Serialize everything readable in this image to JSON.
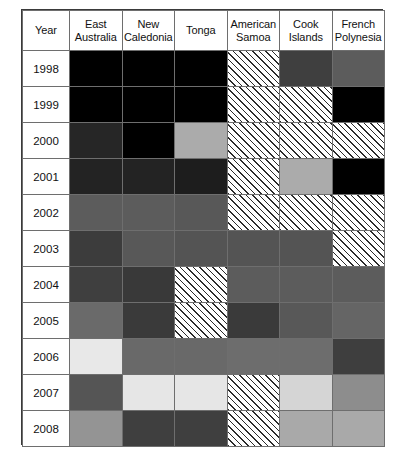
{
  "figure": {
    "type": "matrix-table",
    "row_header_label": "Year"
  },
  "chart_data": {
    "type": "heatmap",
    "title": "",
    "xlabel": "",
    "ylabel": "Year",
    "grid": true,
    "legend_position": "none",
    "row_header": "Year",
    "categories": [
      "East Australia",
      "New Caledonia",
      "Tonga",
      "American Samoa",
      "Cook Islands",
      "French Polynesia"
    ],
    "rows": [
      "1998",
      "1999",
      "2000",
      "2001",
      "2002",
      "2003",
      "2004",
      "2005",
      "2006",
      "2007",
      "2008"
    ],
    "palette": {
      "black": "#000000",
      "very-dark-gray": "#252525",
      "dark-gray": "#3c3c3c",
      "medium-dark-gray": "#4a4a4a",
      "medium-gray": "#5a5a5a",
      "gray": "#6a6a6a",
      "light-medium-gray": "#8d8d8d",
      "light-gray": "#a8a8a8",
      "very-light-gray": "#c9c9c9",
      "near-white": "#e8e8e8",
      "hatched": "diagonal-hatch"
    },
    "cells": [
      {
        "year": "1998",
        "values": [
          {
            "shade": "black",
            "color": "#000000",
            "hatched": false
          },
          {
            "shade": "black",
            "color": "#000000",
            "hatched": false
          },
          {
            "shade": "black",
            "color": "#000000",
            "hatched": false
          },
          {
            "shade": "hatched",
            "color": "#ffffff",
            "hatched": true
          },
          {
            "shade": "dark-gray",
            "color": "#3f3f3f",
            "hatched": false
          },
          {
            "shade": "medium-gray",
            "color": "#5c5c5c",
            "hatched": false
          }
        ]
      },
      {
        "year": "1999",
        "values": [
          {
            "shade": "black",
            "color": "#000000",
            "hatched": false
          },
          {
            "shade": "black",
            "color": "#000000",
            "hatched": false
          },
          {
            "shade": "black",
            "color": "#000000",
            "hatched": false
          },
          {
            "shade": "hatched",
            "color": "#ffffff",
            "hatched": true
          },
          {
            "shade": "hatched",
            "color": "#ffffff",
            "hatched": true
          },
          {
            "shade": "black",
            "color": "#000000",
            "hatched": false
          }
        ]
      },
      {
        "year": "2000",
        "values": [
          {
            "shade": "very-dark-gray",
            "color": "#262626",
            "hatched": false
          },
          {
            "shade": "black",
            "color": "#000000",
            "hatched": false
          },
          {
            "shade": "light-gray",
            "color": "#ababab",
            "hatched": false
          },
          {
            "shade": "hatched",
            "color": "#ffffff",
            "hatched": true
          },
          {
            "shade": "hatched",
            "color": "#ffffff",
            "hatched": true
          },
          {
            "shade": "hatched",
            "color": "#ffffff",
            "hatched": true
          }
        ]
      },
      {
        "year": "2001",
        "values": [
          {
            "shade": "very-dark-gray",
            "color": "#232323",
            "hatched": false
          },
          {
            "shade": "very-dark-gray",
            "color": "#232323",
            "hatched": false
          },
          {
            "shade": "very-dark-gray",
            "color": "#1d1d1d",
            "hatched": false
          },
          {
            "shade": "hatched",
            "color": "#ffffff",
            "hatched": true
          },
          {
            "shade": "light-gray",
            "color": "#ababab",
            "hatched": false
          },
          {
            "shade": "black",
            "color": "#000000",
            "hatched": false
          }
        ]
      },
      {
        "year": "2002",
        "values": [
          {
            "shade": "medium-gray",
            "color": "#5c5c5c",
            "hatched": false
          },
          {
            "shade": "medium-gray",
            "color": "#5c5c5c",
            "hatched": false
          },
          {
            "shade": "medium-gray",
            "color": "#585858",
            "hatched": false
          },
          {
            "shade": "hatched",
            "color": "#ffffff",
            "hatched": true
          },
          {
            "shade": "hatched",
            "color": "#ffffff",
            "hatched": true
          },
          {
            "shade": "hatched",
            "color": "#ffffff",
            "hatched": true
          }
        ]
      },
      {
        "year": "2003",
        "values": [
          {
            "shade": "dark-gray",
            "color": "#3c3c3c",
            "hatched": false
          },
          {
            "shade": "medium-gray",
            "color": "#585858",
            "hatched": false
          },
          {
            "shade": "medium-gray",
            "color": "#545454",
            "hatched": false
          },
          {
            "shade": "medium-gray",
            "color": "#545454",
            "hatched": false
          },
          {
            "shade": "medium-gray",
            "color": "#545454",
            "hatched": false
          },
          {
            "shade": "hatched",
            "color": "#ffffff",
            "hatched": true
          }
        ]
      },
      {
        "year": "2004",
        "values": [
          {
            "shade": "dark-gray",
            "color": "#3f3f3f",
            "hatched": false
          },
          {
            "shade": "dark-gray",
            "color": "#393939",
            "hatched": false
          },
          {
            "shade": "hatched",
            "color": "#ffffff",
            "hatched": true
          },
          {
            "shade": "medium-gray",
            "color": "#5c5c5c",
            "hatched": false
          },
          {
            "shade": "medium-gray",
            "color": "#5c5c5c",
            "hatched": false
          },
          {
            "shade": "medium-gray",
            "color": "#5c5c5c",
            "hatched": false
          }
        ]
      },
      {
        "year": "2005",
        "values": [
          {
            "shade": "gray",
            "color": "#6a6a6a",
            "hatched": false
          },
          {
            "shade": "dark-gray",
            "color": "#3a3a3a",
            "hatched": false
          },
          {
            "shade": "hatched",
            "color": "#ffffff",
            "hatched": true
          },
          {
            "shade": "dark-gray",
            "color": "#3a3a3a",
            "hatched": false
          },
          {
            "shade": "medium-gray",
            "color": "#585858",
            "hatched": false
          },
          {
            "shade": "gray",
            "color": "#656565",
            "hatched": false
          }
        ]
      },
      {
        "year": "2006",
        "values": [
          {
            "shade": "near-white",
            "color": "#e8e8e8",
            "hatched": false
          },
          {
            "shade": "gray",
            "color": "#696969",
            "hatched": false
          },
          {
            "shade": "gray",
            "color": "#696969",
            "hatched": false
          },
          {
            "shade": "gray",
            "color": "#6d6d6d",
            "hatched": false
          },
          {
            "shade": "gray",
            "color": "#6d6d6d",
            "hatched": false
          },
          {
            "shade": "dark-gray",
            "color": "#3e3e3e",
            "hatched": false
          }
        ]
      },
      {
        "year": "2007",
        "values": [
          {
            "shade": "medium-gray",
            "color": "#555555",
            "hatched": false
          },
          {
            "shade": "near-white",
            "color": "#e6e6e6",
            "hatched": false
          },
          {
            "shade": "near-white",
            "color": "#e6e6e6",
            "hatched": false
          },
          {
            "shade": "hatched",
            "color": "#ffffff",
            "hatched": true
          },
          {
            "shade": "very-light-gray",
            "color": "#d5d5d5",
            "hatched": false
          },
          {
            "shade": "light-medium-gray",
            "color": "#8d8d8d",
            "hatched": false
          }
        ]
      },
      {
        "year": "2008",
        "values": [
          {
            "shade": "light-medium-gray",
            "color": "#949494",
            "hatched": false
          },
          {
            "shade": "dark-gray",
            "color": "#3f3f3f",
            "hatched": false
          },
          {
            "shade": "dark-gray",
            "color": "#3f3f3f",
            "hatched": false
          },
          {
            "shade": "hatched",
            "color": "#ffffff",
            "hatched": true
          },
          {
            "shade": "light-gray",
            "color": "#a9a9a9",
            "hatched": false
          },
          {
            "shade": "light-gray",
            "color": "#a9a9a9",
            "hatched": false
          }
        ]
      }
    ]
  }
}
